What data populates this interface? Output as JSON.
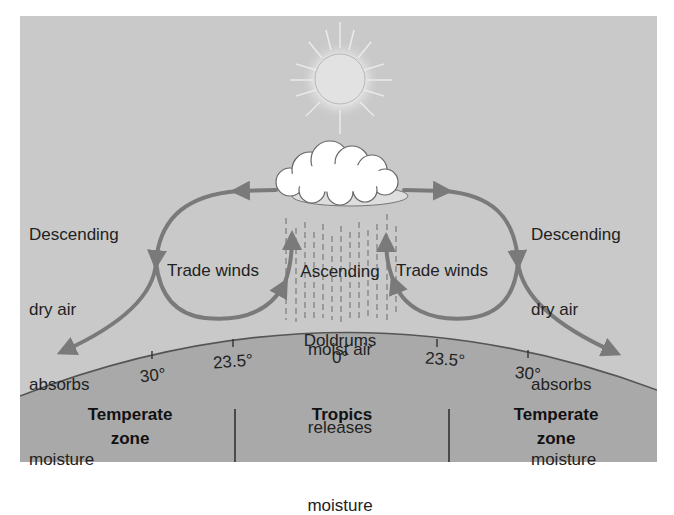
{
  "diagram": {
    "colors": {
      "background": "#ffffff",
      "sky": "#c9c9c9",
      "ground": "#a9a9a9",
      "horizon_line": "#555555",
      "arrows": "#7a7a7a",
      "sun": "#e2e2e2",
      "cloud": "#ffffff",
      "rain": "#8a8a8a",
      "text": "#222222"
    },
    "icons": {
      "sun": "sun-icon",
      "cloud": "cloud-icon",
      "rain": "rain-streaks"
    },
    "labels": {
      "left_descending": [
        "Descending",
        "dry air",
        "absorbs",
        "moisture"
      ],
      "right_descending": [
        "Descending",
        "dry air",
        "absorbs",
        "moisture"
      ],
      "left_trade_winds": "Trade winds",
      "right_trade_winds": "Trade winds",
      "center_ascending": [
        "Ascending",
        "moist air",
        "releases",
        "moisture"
      ],
      "doldrums": "Doldrums"
    },
    "latitudes": {
      "left_30": "30°",
      "left_23_5": "23.5°",
      "equator": "0°",
      "right_23_5": "23.5°",
      "right_30": "30°"
    },
    "zones": {
      "left": "Temperate\nzone",
      "center": "Tropics",
      "right": "Temperate\nzone"
    }
  }
}
